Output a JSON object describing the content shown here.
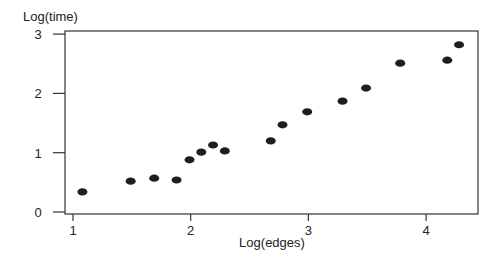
{
  "chart_data": {
    "type": "scatter",
    "title": "",
    "xlabel": "Log(edges)",
    "ylabel": "Log(time)",
    "xlim": [
      0.95,
      4.45
    ],
    "ylim": [
      -0.05,
      3.05
    ],
    "xticks": [
      1,
      2,
      3,
      4
    ],
    "yticks": [
      0,
      1,
      2,
      3
    ],
    "grid": false,
    "legend": null,
    "marker_color": "#1e1e1e",
    "points": [
      {
        "x": 1.08,
        "y": 0.34
      },
      {
        "x": 1.49,
        "y": 0.52
      },
      {
        "x": 1.69,
        "y": 0.57
      },
      {
        "x": 1.88,
        "y": 0.54
      },
      {
        "x": 1.99,
        "y": 0.88
      },
      {
        "x": 2.09,
        "y": 1.01
      },
      {
        "x": 2.19,
        "y": 1.13
      },
      {
        "x": 2.29,
        "y": 1.03
      },
      {
        "x": 2.68,
        "y": 1.2
      },
      {
        "x": 2.78,
        "y": 1.47
      },
      {
        "x": 2.99,
        "y": 1.69
      },
      {
        "x": 3.29,
        "y": 1.87
      },
      {
        "x": 3.49,
        "y": 2.09
      },
      {
        "x": 3.78,
        "y": 2.51
      },
      {
        "x": 4.18,
        "y": 2.56
      },
      {
        "x": 4.28,
        "y": 2.82
      }
    ]
  }
}
